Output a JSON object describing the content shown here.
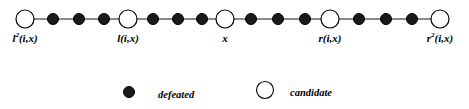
{
  "figure": {
    "width": 469,
    "height": 109,
    "background": "#ffffff",
    "line_color": "#4d4d4d",
    "node_fill_defeated": "#1a1a1a",
    "node_fill_candidate": "#ffffff",
    "node_stroke": "#000000"
  },
  "chart_data": {
    "type": "diagram",
    "subtype": "path-graph",
    "title": "",
    "nodes": [
      {
        "id": "n0",
        "kind": "candidate",
        "x": 25,
        "y": 19,
        "r": 9,
        "label": "l2(i,x)"
      },
      {
        "id": "n1",
        "kind": "defeated",
        "x": 53,
        "y": 19,
        "r": 5.5,
        "label": ""
      },
      {
        "id": "n2",
        "kind": "defeated",
        "x": 79,
        "y": 19,
        "r": 5.5,
        "label": ""
      },
      {
        "id": "n3",
        "kind": "defeated",
        "x": 104,
        "y": 19,
        "r": 5.5,
        "label": ""
      },
      {
        "id": "n4",
        "kind": "candidate",
        "x": 128,
        "y": 19,
        "r": 9,
        "label": "l(i,x)"
      },
      {
        "id": "n5",
        "kind": "defeated",
        "x": 153,
        "y": 19,
        "r": 5.5,
        "label": ""
      },
      {
        "id": "n6",
        "kind": "defeated",
        "x": 178,
        "y": 19,
        "r": 5.5,
        "label": ""
      },
      {
        "id": "n7",
        "kind": "defeated",
        "x": 202,
        "y": 19,
        "r": 5.5,
        "label": ""
      },
      {
        "id": "n8",
        "kind": "candidate",
        "x": 225,
        "y": 19,
        "r": 9,
        "label": "x"
      },
      {
        "id": "n9",
        "kind": "defeated",
        "x": 251,
        "y": 19,
        "r": 5.5,
        "label": ""
      },
      {
        "id": "n10",
        "kind": "defeated",
        "x": 278,
        "y": 19,
        "r": 5.5,
        "label": ""
      },
      {
        "id": "n11",
        "kind": "defeated",
        "x": 305,
        "y": 19,
        "r": 5.5,
        "label": ""
      },
      {
        "id": "n12",
        "kind": "candidate",
        "x": 330,
        "y": 19,
        "r": 9,
        "label": "r(i,x)"
      },
      {
        "id": "n13",
        "kind": "defeated",
        "x": 359,
        "y": 19,
        "r": 5.5,
        "label": ""
      },
      {
        "id": "n14",
        "kind": "defeated",
        "x": 386,
        "y": 19,
        "r": 5.5,
        "label": ""
      },
      {
        "id": "n15",
        "kind": "defeated",
        "x": 412,
        "y": 19,
        "r": 5.5,
        "label": ""
      },
      {
        "id": "n16",
        "kind": "candidate",
        "x": 440,
        "y": 19,
        "r": 9,
        "label": "r2(i,x)"
      }
    ],
    "edges": [
      [
        "n0",
        "n1"
      ],
      [
        "n1",
        "n2"
      ],
      [
        "n2",
        "n3"
      ],
      [
        "n3",
        "n4"
      ],
      [
        "n4",
        "n5"
      ],
      [
        "n5",
        "n6"
      ],
      [
        "n6",
        "n7"
      ],
      [
        "n7",
        "n8"
      ],
      [
        "n8",
        "n9"
      ],
      [
        "n9",
        "n10"
      ],
      [
        "n10",
        "n11"
      ],
      [
        "n11",
        "n12"
      ],
      [
        "n12",
        "n13"
      ],
      [
        "n13",
        "n14"
      ],
      [
        "n14",
        "n15"
      ],
      [
        "n15",
        "n16"
      ]
    ],
    "axis_labels": [
      {
        "text_base": "l",
        "superscript": "2",
        "text_rest": "(i,x)",
        "x": 25,
        "y": 33
      },
      {
        "text_base": "l",
        "superscript": "",
        "text_rest": "(i,x)",
        "x": 128,
        "y": 33
      },
      {
        "text_base": "x",
        "superscript": "",
        "text_rest": "",
        "x": 225,
        "y": 33
      },
      {
        "text_base": "r",
        "superscript": "",
        "text_rest": "(i,x)",
        "x": 330,
        "y": 33
      },
      {
        "text_base": "r",
        "superscript": "2",
        "text_rest": "(i,x)",
        "x": 440,
        "y": 33
      }
    ],
    "legend": {
      "position": "bottom-center",
      "entries": [
        {
          "marker": "filled-circle",
          "label": "defeated",
          "x": 120,
          "y": 4
        },
        {
          "marker": "open-circle",
          "label": "candidate",
          "x": 254,
          "y": 2
        }
      ]
    }
  }
}
